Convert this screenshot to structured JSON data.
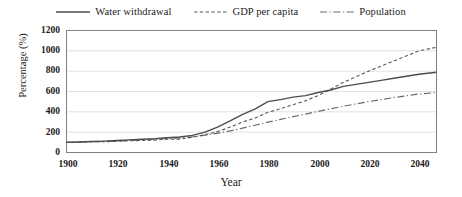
{
  "chart_data": {
    "type": "line",
    "title": "",
    "xlabel": "Year",
    "ylabel": "Percentage (%)",
    "xlim": [
      1900,
      2047
    ],
    "ylim": [
      0,
      1200
    ],
    "xticks": [
      1900,
      1920,
      1940,
      1960,
      1980,
      2000,
      2020,
      2040
    ],
    "yticks": [
      0,
      200,
      400,
      600,
      800,
      1000,
      1200
    ],
    "grid": "horizontal",
    "legend_position": "top-center",
    "x": [
      1900,
      1905,
      1910,
      1915,
      1920,
      1925,
      1930,
      1935,
      1940,
      1945,
      1950,
      1955,
      1960,
      1965,
      1970,
      1975,
      1980,
      1985,
      1990,
      1995,
      2000,
      2005,
      2010,
      2015,
      2020,
      2025,
      2030,
      2035,
      2040,
      2047
    ],
    "series": [
      {
        "name": "Water withdrawal",
        "style": "solid",
        "color": "#4d4d4d",
        "values": [
          100,
          103,
          108,
          112,
          118,
          124,
          130,
          136,
          145,
          152,
          168,
          200,
          250,
          310,
          375,
          430,
          500,
          520,
          545,
          560,
          590,
          615,
          650,
          670,
          690,
          710,
          730,
          750,
          770,
          790
        ]
      },
      {
        "name": "GDP per capita",
        "style": "dashed",
        "color": "#595959",
        "values": [
          100,
          102,
          105,
          106,
          110,
          116,
          118,
          122,
          130,
          132,
          150,
          175,
          205,
          250,
          300,
          340,
          395,
          430,
          470,
          510,
          560,
          625,
          690,
          745,
          800,
          850,
          900,
          950,
          1000,
          1035
        ]
      },
      {
        "name": "Population",
        "style": "dashdot",
        "color": "#6b6b6b",
        "values": [
          100,
          103,
          106,
          108,
          112,
          118,
          124,
          130,
          138,
          144,
          155,
          170,
          190,
          212,
          240,
          268,
          298,
          325,
          352,
          378,
          405,
          430,
          455,
          478,
          500,
          520,
          540,
          558,
          575,
          590
        ]
      }
    ]
  },
  "legend": [
    {
      "label": "Water withdrawal",
      "key": "solid-line-key"
    },
    {
      "label": "GDP per capita",
      "key": "dashed-line-key"
    },
    {
      "label": "Population",
      "key": "dashdot-line-key"
    }
  ],
  "axis": {
    "y_title": "Percentage (%)",
    "x_title": "Year",
    "y_ticks": [
      "1200",
      "1000",
      "800",
      "600",
      "400",
      "200",
      "0"
    ],
    "x_ticks": [
      "1900",
      "1920",
      "1940",
      "1960",
      "1980",
      "2000",
      "2020",
      "2040"
    ]
  },
  "colors": {
    "plot_border": "#808080",
    "gridline": "#e2e2e2",
    "water": "#4d4d4d",
    "gdp": "#595959",
    "population": "#6b6b6b",
    "text": "#1a1a1a",
    "background": "#ffffff"
  }
}
